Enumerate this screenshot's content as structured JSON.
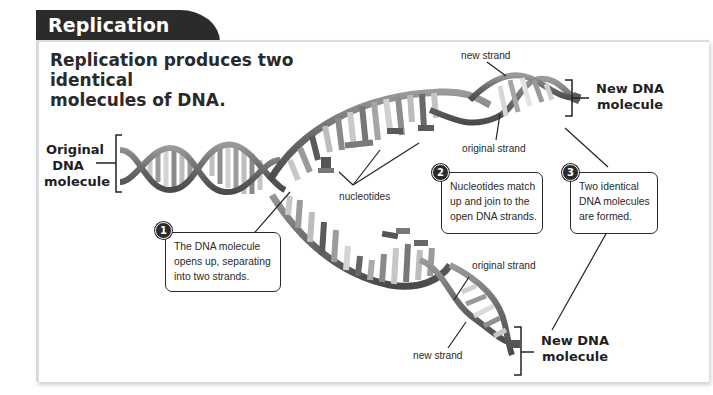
{
  "header": {
    "tab_title": "Replication"
  },
  "heading": "Replication produces two identical molecules of DNA.",
  "heading_lines": [
    "Replication produces two identical",
    "molecules of DNA."
  ],
  "labels": {
    "original_dna": [
      "Original",
      "DNA",
      "molecule"
    ],
    "new_dna_top": [
      "New DNA",
      "molecule"
    ],
    "new_dna_bottom": [
      "New DNA",
      "molecule"
    ],
    "new_strand_top": "new strand",
    "original_strand_top": "original strand",
    "nucleotides": "nucleotides",
    "original_strand_bottom": "original strand",
    "new_strand_bottom": "new strand"
  },
  "steps": [
    {
      "number": "1",
      "lines": [
        "The DNA molecule",
        "opens up, separating",
        "into two strands."
      ]
    },
    {
      "number": "2",
      "lines": [
        "Nucleotides match",
        "up and join to the",
        "open DNA strands."
      ]
    },
    {
      "number": "3",
      "lines": [
        "Two identical",
        "DNA molecules",
        "are formed."
      ]
    }
  ],
  "colors": {
    "tab_bg": "#2b2b2b",
    "strand": "#6e6e6e",
    "base_light": "#c8c8c8",
    "base_mid": "#9a9a9a",
    "base_dark": "#555555"
  }
}
